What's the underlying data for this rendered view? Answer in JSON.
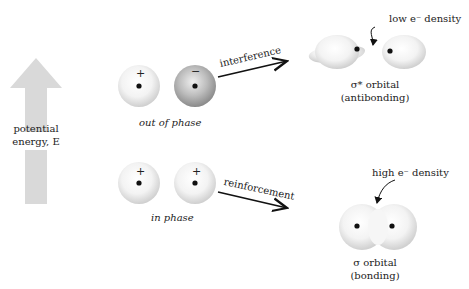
{
  "energy_axis": {
    "label_line1": "potential",
    "label_line2": "energy, E",
    "arrow_color": "#d9d9d9"
  },
  "out_of_phase": {
    "label": "out of phase",
    "left_sign": "+",
    "right_sign": "−",
    "arrow_label": "interference"
  },
  "in_phase": {
    "label": "in phase",
    "left_sign": "+",
    "right_sign": "+",
    "arrow_label": "reinforcement"
  },
  "antibonding": {
    "annotation": "low e⁻ density",
    "title_line1": "σ* orbital",
    "title_line2": "(antibonding)"
  },
  "bonding": {
    "annotation": "high e⁻ density",
    "title_line1": "σ orbital",
    "title_line2": "(bonding)"
  }
}
